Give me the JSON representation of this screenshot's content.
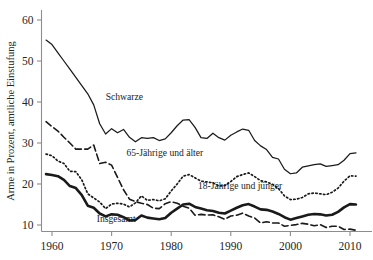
{
  "chart_data": {
    "type": "line",
    "title": "",
    "xlabel": "",
    "ylabel": "Arme in Prozent, amtliche Einstufung",
    "xlim": [
      1958,
      2012
    ],
    "ylim": [
      7.5,
      62
    ],
    "grid": false,
    "legend": "inline-annotations",
    "xticks": [
      1960,
      1970,
      1980,
      1990,
      2000,
      2010
    ],
    "xtick_labels": [
      "1960",
      "1970",
      "1980",
      "1990",
      "2000",
      "2010"
    ],
    "yticks": [
      10,
      20,
      30,
      40,
      50,
      60
    ],
    "ytick_labels": [
      "10",
      "20",
      "30",
      "40",
      "50",
      "60"
    ],
    "series": [
      {
        "name": "Schwarze",
        "style": "solid-thin",
        "color": "#1a1a1a",
        "label_x": 1969,
        "label_y": 40.5,
        "x": [
          1959,
          1960,
          1961,
          1962,
          1963,
          1964,
          1965,
          1966,
          1967,
          1968,
          1969,
          1970,
          1971,
          1972,
          1973,
          1974,
          1975,
          1976,
          1977,
          1978,
          1979,
          1980,
          1981,
          1982,
          1983,
          1984,
          1985,
          1986,
          1987,
          1988,
          1989,
          1990,
          1991,
          1992,
          1993,
          1994,
          1995,
          1996,
          1997,
          1998,
          1999,
          2000,
          2001,
          2002,
          2003,
          2004,
          2005,
          2006,
          2007,
          2008,
          2009,
          2010,
          2011
        ],
        "y": [
          55.1,
          54.0,
          52.0,
          50.0,
          48.0,
          46.0,
          44.0,
          42.0,
          39.3,
          34.7,
          32.2,
          33.5,
          32.5,
          33.3,
          31.4,
          30.3,
          31.3,
          31.1,
          31.3,
          30.6,
          31.0,
          32.5,
          34.2,
          35.6,
          35.7,
          33.8,
          31.3,
          31.1,
          32.4,
          31.3,
          30.7,
          31.9,
          32.7,
          33.4,
          33.1,
          30.6,
          29.3,
          28.4,
          26.5,
          26.1,
          23.6,
          22.5,
          22.7,
          24.1,
          24.4,
          24.7,
          24.9,
          24.3,
          24.5,
          24.7,
          25.8,
          27.4,
          27.6
        ]
      },
      {
        "name": "65-Jährige und älter",
        "style": "dashed",
        "color": "#1a1a1a",
        "label_x": 1972.5,
        "label_y": 26.8,
        "x": [
          1959,
          1960,
          1961,
          1962,
          1963,
          1964,
          1965,
          1966,
          1967,
          1968,
          1969,
          1970,
          1971,
          1972,
          1973,
          1974,
          1975,
          1976,
          1977,
          1978,
          1979,
          1980,
          1981,
          1982,
          1983,
          1984,
          1985,
          1986,
          1987,
          1988,
          1989,
          1990,
          1991,
          1992,
          1993,
          1994,
          1995,
          1996,
          1997,
          1998,
          1999,
          2000,
          2001,
          2002,
          2003,
          2004,
          2005,
          2006,
          2007,
          2008,
          2009,
          2010,
          2011
        ],
        "y": [
          35.2,
          34.0,
          32.9,
          31.4,
          30.0,
          28.5,
          28.5,
          28.5,
          29.5,
          25.0,
          25.3,
          24.6,
          21.6,
          18.6,
          16.3,
          15.7,
          15.3,
          15.0,
          14.1,
          14.0,
          15.2,
          15.7,
          15.3,
          14.6,
          14.1,
          12.4,
          12.6,
          12.4,
          12.5,
          12.0,
          11.4,
          12.2,
          12.4,
          12.9,
          12.2,
          11.7,
          10.5,
          10.8,
          10.5,
          10.5,
          9.7,
          9.9,
          10.1,
          10.4,
          10.2,
          9.8,
          10.1,
          9.4,
          9.7,
          9.7,
          8.9,
          9.0,
          8.7
        ]
      },
      {
        "name": "18-Jährige und jünger",
        "style": "dotted",
        "color": "#1a1a1a",
        "label_x": 1984.5,
        "label_y": 18.8,
        "x": [
          1959,
          1960,
          1961,
          1962,
          1963,
          1964,
          1965,
          1966,
          1967,
          1968,
          1969,
          1970,
          1971,
          1972,
          1973,
          1974,
          1975,
          1976,
          1977,
          1978,
          1979,
          1980,
          1981,
          1982,
          1983,
          1984,
          1985,
          1986,
          1987,
          1988,
          1989,
          1990,
          1991,
          1992,
          1993,
          1994,
          1995,
          1996,
          1997,
          1998,
          1999,
          2000,
          2001,
          2002,
          2003,
          2004,
          2005,
          2006,
          2007,
          2008,
          2009,
          2010,
          2011
        ],
        "y": [
          27.3,
          26.9,
          25.6,
          25.0,
          23.1,
          23.0,
          21.0,
          17.6,
          16.6,
          15.6,
          14.0,
          15.1,
          15.3,
          15.1,
          14.4,
          15.4,
          17.1,
          16.0,
          16.2,
          15.9,
          16.4,
          18.3,
          20.0,
          21.9,
          22.3,
          21.5,
          20.7,
          20.5,
          20.3,
          19.5,
          19.6,
          20.6,
          21.8,
          22.3,
          22.7,
          21.8,
          20.8,
          20.5,
          19.9,
          18.9,
          17.1,
          16.2,
          16.3,
          16.7,
          17.6,
          17.8,
          17.6,
          17.4,
          18.0,
          19.0,
          20.7,
          22.0,
          21.9
        ]
      },
      {
        "name": "Insgesamt",
        "style": "solid-thick",
        "color": "#1a1a1a",
        "label_x": 1967.5,
        "label_y": 10.8,
        "x": [
          1959,
          1960,
          1961,
          1962,
          1963,
          1964,
          1965,
          1966,
          1967,
          1968,
          1969,
          1970,
          1971,
          1972,
          1973,
          1974,
          1975,
          1976,
          1977,
          1978,
          1979,
          1980,
          1981,
          1982,
          1983,
          1984,
          1985,
          1986,
          1987,
          1988,
          1989,
          1990,
          1991,
          1992,
          1993,
          1994,
          1995,
          1996,
          1997,
          1998,
          1999,
          2000,
          2001,
          2002,
          2003,
          2004,
          2005,
          2006,
          2007,
          2008,
          2009,
          2010,
          2011
        ],
        "y": [
          22.4,
          22.2,
          21.9,
          21.0,
          19.5,
          19.0,
          17.3,
          14.7,
          14.2,
          12.8,
          12.1,
          12.6,
          12.5,
          11.9,
          11.1,
          11.2,
          12.3,
          11.8,
          11.6,
          11.4,
          11.7,
          13.0,
          14.0,
          15.0,
          15.2,
          14.4,
          14.0,
          13.6,
          13.4,
          13.0,
          12.8,
          13.5,
          14.2,
          14.8,
          15.1,
          14.5,
          13.8,
          13.7,
          13.3,
          12.7,
          11.9,
          11.3,
          11.7,
          12.1,
          12.5,
          12.7,
          12.6,
          12.3,
          12.5,
          13.2,
          14.3,
          15.1,
          15.0
        ]
      }
    ]
  }
}
